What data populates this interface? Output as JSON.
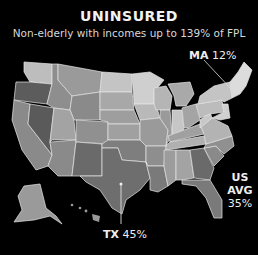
{
  "header": {
    "title": "UNINSURED",
    "subtitle": "Non-elderly with incomes up to 139% of FPL"
  },
  "callouts": {
    "ma": {
      "state": "MA",
      "value": "12%"
    },
    "tx": {
      "state": "TX",
      "value": "45%"
    },
    "us_avg": {
      "label": "US AVG",
      "value": "35%"
    }
  },
  "colors": {
    "background": "#000000",
    "border": "#e8e8e8",
    "light": "#c8c8c8",
    "mid": "#9a9a9a",
    "dark": "#6e6e6e",
    "darkest": "#555555"
  }
}
